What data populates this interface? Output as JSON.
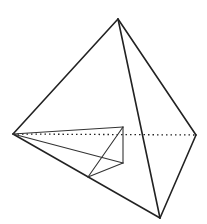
{
  "diagram": {
    "type": "tetrahedron",
    "vertices": {
      "top": "A",
      "left": "B",
      "right": "C",
      "bottom": "D"
    },
    "inner_points": [
      "E",
      "F",
      "G"
    ],
    "edges": [
      {
        "from": "top",
        "to": "left",
        "style": "solid"
      },
      {
        "from": "top",
        "to": "right",
        "style": "solid"
      },
      {
        "from": "top",
        "to": "bottom",
        "style": "solid"
      },
      {
        "from": "left",
        "to": "bottom",
        "style": "solid"
      },
      {
        "from": "right",
        "to": "bottom",
        "style": "solid"
      },
      {
        "from": "left",
        "to": "right",
        "style": "dotted"
      }
    ],
    "colors": {
      "line": "#222222",
      "background": "#ffffff"
    }
  }
}
